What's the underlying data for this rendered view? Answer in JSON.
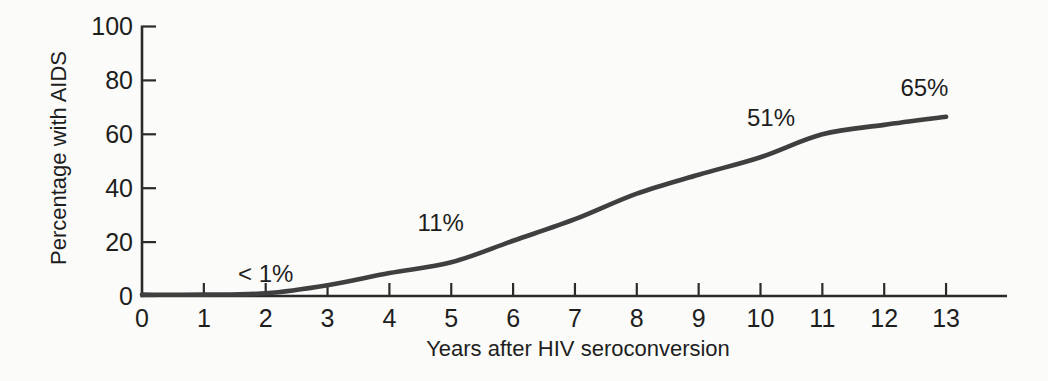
{
  "chart_data": {
    "type": "line",
    "title": "",
    "xlabel": "Years after HIV seroconversion",
    "ylabel": "Percentage with AIDS",
    "x": [
      0,
      1,
      2,
      3,
      4,
      5,
      6,
      7,
      8,
      9,
      10,
      11,
      12,
      13
    ],
    "values": [
      0.5,
      0.5,
      1,
      4,
      8.5,
      12.5,
      20.5,
      28.5,
      38,
      45,
      51.5,
      60,
      63.5,
      66.5
    ],
    "xticks": [
      0,
      1,
      2,
      3,
      4,
      5,
      6,
      7,
      8,
      9,
      10,
      11,
      12,
      13
    ],
    "yticks": [
      0,
      20,
      40,
      60,
      80,
      100
    ],
    "xlim": [
      0,
      14
    ],
    "ylim": [
      0,
      100
    ],
    "grid": false,
    "legend_position": "none",
    "annotations": [
      {
        "label": "< 1%",
        "x": 2.0,
        "y": 8.5
      },
      {
        "label": "11%",
        "x": 4.83,
        "y": 27.5
      },
      {
        "label": "51%",
        "x": 10.17,
        "y": 66.5
      },
      {
        "label": "65%",
        "x": 12.65,
        "y": 77.5
      }
    ],
    "colors": {
      "line": "#3f3f3f",
      "axis": "#2b2b2b",
      "text": "#1e1e1e",
      "background": "#fbfbf9"
    }
  }
}
